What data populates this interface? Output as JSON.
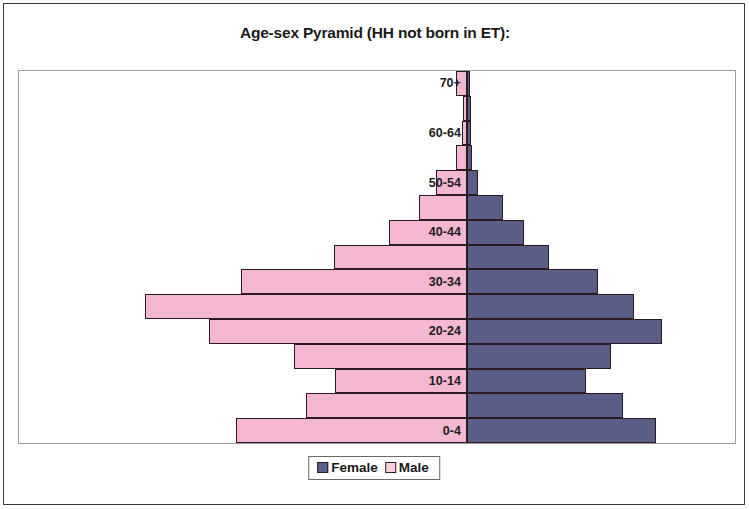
{
  "chart_data": {
    "type": "bar",
    "subtype": "population-pyramid",
    "title": "Age-sex Pyramid (HH not born in ET):",
    "xlabel": "",
    "ylabel": "",
    "grid": false,
    "legend_position": "bottom-center",
    "orientation": "horizontal",
    "categories": [
      "0-4",
      "5-9",
      "10-14",
      "15-19",
      "20-24",
      "25-29",
      "30-34",
      "35-39",
      "40-44",
      "45-49",
      "50-54",
      "55-59",
      "60-64",
      "65-69",
      "70+"
    ],
    "visible_tick_labels": [
      "0-4",
      "10-14",
      "20-24",
      "30-34",
      "40-44",
      "50-54",
      "60-64",
      "70+"
    ],
    "series": [
      {
        "name": "Male",
        "side": "left",
        "color": "#f4b7d2",
        "values": [
          23.7,
          16.5,
          13.5,
          17.8,
          26.5,
          33.1,
          23.2,
          13.6,
          8.0,
          4.9,
          3.2,
          1.1,
          0.5,
          0.4,
          1.1
        ]
      },
      {
        "name": "Female",
        "side": "right",
        "color": "#5a5d86",
        "values": [
          23.0,
          19.0,
          14.5,
          17.5,
          23.7,
          20.4,
          16.0,
          10.0,
          7.0,
          4.4,
          1.4,
          0.6,
          0.5,
          0.5,
          0.4
        ]
      }
    ],
    "axis_max_left": 34.0,
    "axis_max_right": 28.0
  },
  "chart": {
    "title": "Age-sex Pyramid (HH not born in ET):",
    "legend": {
      "female_label": "Female",
      "male_label": "Male",
      "female_color": "#5a5d86",
      "male_color": "#f7cede"
    }
  }
}
